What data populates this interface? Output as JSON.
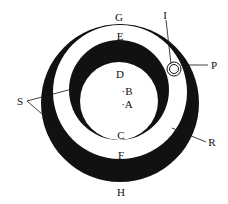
{
  "diagram": {
    "type": "nested eccentric circles",
    "colors": {
      "fill_dark": "#111111",
      "background": "#ffffff",
      "line": "#111111"
    },
    "labels": {
      "G": "G",
      "E": "E",
      "D": "D",
      "B": "·B",
      "A": "·A",
      "C": "C",
      "F": "F",
      "H": "H",
      "I": "I",
      "P": "P",
      "S": "S",
      "R": "R"
    }
  }
}
